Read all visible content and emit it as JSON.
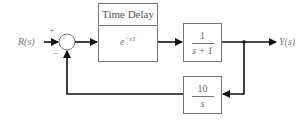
{
  "diagram": {
    "input_label": "R(s)",
    "output_label": "Y(s)",
    "summing_junction": {
      "plus_sign": "+",
      "minus_sign": "−"
    },
    "blocks": [
      {
        "id": "time-delay",
        "title": "Time Delay",
        "expression": "e",
        "expression_exponent": "−sT"
      },
      {
        "id": "plant",
        "numerator": "1",
        "denominator": "s + 1"
      },
      {
        "id": "feedback",
        "numerator": "10",
        "denominator": "s"
      }
    ],
    "colors": {
      "line": "#111111",
      "block_border": "#777777",
      "text": "#777777"
    }
  }
}
